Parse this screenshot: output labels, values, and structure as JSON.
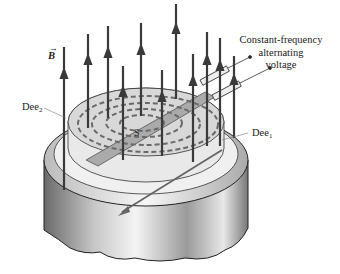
{
  "diagram": {
    "labels": {
      "field": "B",
      "field_vector_marker": "→",
      "dee2_base": "Dee",
      "dee2_sub": "2",
      "dee1_base": "Dee",
      "dee1_sub": "1",
      "source": "S",
      "voltage_line1": "Constant-frequency",
      "voltage_line2": "alternating",
      "voltage_line3": "voltage"
    },
    "colors": {
      "field_line": "#3a3a3a",
      "dee_fill": "#d8d8d8",
      "dashed_path": "#6a6a6a",
      "magnet_dark": "#555555",
      "magnet_light": "#f2f2f2"
    }
  }
}
